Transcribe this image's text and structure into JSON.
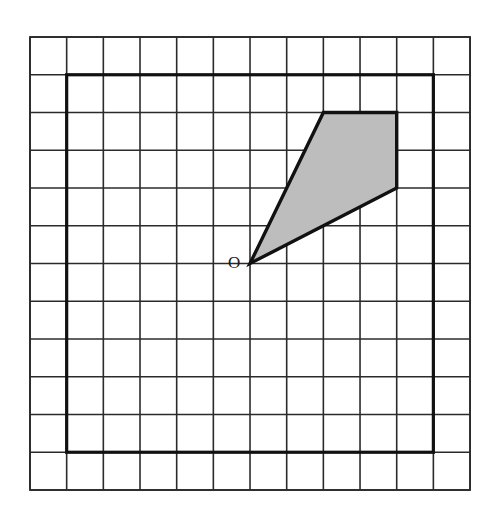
{
  "figure": {
    "kind": "grid-geometry-diagram",
    "canvas": {
      "width": 494,
      "height": 519,
      "background": "#ffffff"
    },
    "grid": {
      "name": "square-lattice",
      "columns": 12,
      "rows": 12,
      "origin_px": {
        "x": 30,
        "y": 37
      },
      "cell_width_px": 36.67,
      "cell_height_px": 37.75,
      "line_color": "#2b2b2b",
      "line_width_px": 1.6,
      "outer_border_width_px": 1.8
    },
    "bold_square": {
      "name": "bold-inner-square",
      "description": "Heavy square outline inset one cell from the lattice border",
      "from_cell": {
        "col": 1,
        "row": 1
      },
      "to_cell": {
        "col": 11,
        "row": 11
      },
      "stroke_color": "#111111",
      "stroke_width_px": 3.2,
      "fill": "none"
    },
    "shaded_polygon": {
      "name": "shaded-quadrilateral",
      "description": "Kite-like quadrilateral with apex at point O",
      "vertices_grid": [
        {
          "label": "O",
          "col": 6,
          "row": 6
        },
        {
          "label": "A",
          "col": 8,
          "row": 2
        },
        {
          "label": "B",
          "col": 10,
          "row": 2
        },
        {
          "label": "C",
          "col": 10,
          "row": 4
        }
      ],
      "fill_color": "#bdbdbd",
      "fill_opacity": 1,
      "stroke_color": "#111111",
      "stroke_width_px": 3.4
    },
    "labels": [
      {
        "name": "origin-point-label",
        "text": "O",
        "at_grid": {
          "col": 6,
          "row": 6
        },
        "offset_px": {
          "x": -16,
          "y": 1
        },
        "color": "#1a1a1a",
        "font_size_px": 17
      }
    ]
  },
  "chart_data": {
    "type": "scatter",
    "title": "",
    "xlabel": "",
    "ylabel": "",
    "xlim": [
      0,
      12
    ],
    "ylim": [
      0,
      12
    ],
    "grid": true,
    "legend": null,
    "annotations": [
      {
        "text": "O",
        "x": 6,
        "y": 6
      }
    ],
    "series": [
      {
        "name": "shaded-quadrilateral",
        "kind": "polygon",
        "fill": "#bdbdbd",
        "stroke": "#111111",
        "x": [
          6,
          8,
          10,
          10
        ],
        "y": [
          6,
          2,
          2,
          4
        ]
      },
      {
        "name": "bold-inner-square",
        "kind": "polygon",
        "fill": "none",
        "stroke": "#111111",
        "x": [
          1,
          11,
          11,
          1
        ],
        "y": [
          1,
          1,
          11,
          11
        ]
      }
    ]
  }
}
